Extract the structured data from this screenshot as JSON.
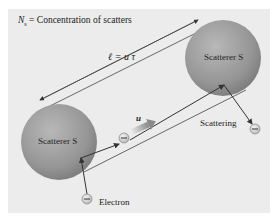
{
  "diagram": {
    "title_symbol": "N",
    "title_subscript": "s",
    "title_text": " = Concentration of scatters",
    "mean_free_path_label": "ℓ = u τ",
    "drift_velocity_label": "u",
    "scatterer_left_label": "Scatterer S",
    "scatterer_right_label": "Scatterer S",
    "scattering_label": "Scattering",
    "electron_label": "Electron",
    "electron_symbol": "−",
    "colors": {
      "panel_background": "#ececec",
      "sphere_fill": "#9a9a9a",
      "line": "#333333",
      "electron_fill": "#d0d0d0"
    }
  }
}
